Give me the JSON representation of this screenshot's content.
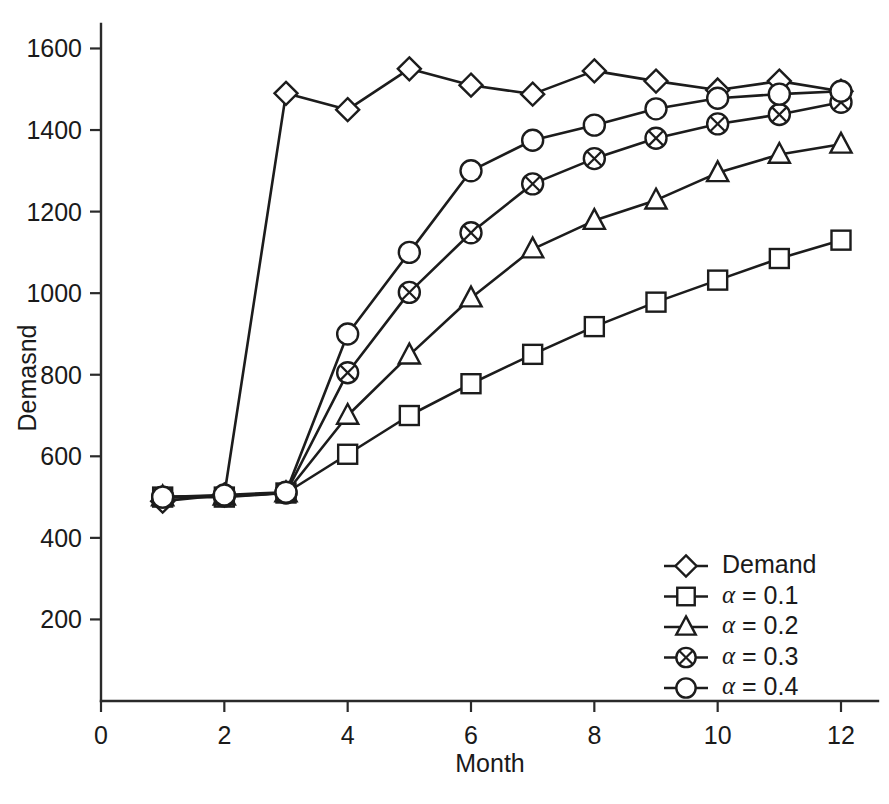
{
  "chart_data": {
    "type": "line",
    "title": "",
    "xlabel": "Month",
    "ylabel": "Demasnd",
    "x": [
      1,
      2,
      3,
      4,
      5,
      6,
      7,
      8,
      9,
      10,
      11,
      12
    ],
    "xlim": [
      0,
      12.6
    ],
    "ylim": [
      0,
      1660
    ],
    "xticks": [
      0,
      2,
      4,
      6,
      8,
      10,
      12
    ],
    "xticklabels": [
      "0",
      "2",
      "4",
      "6",
      "8",
      "10",
      "12"
    ],
    "yticks": [
      200,
      400,
      600,
      800,
      1000,
      1200,
      1400,
      1600
    ],
    "yticklabels": [
      "200",
      "400",
      "600",
      "800",
      "1000",
      "1200",
      "1400",
      "1600"
    ],
    "grid": false,
    "legend_position": "lower-right",
    "series": [
      {
        "name": "Demand",
        "marker": "diamond",
        "values": [
          490,
          505,
          1490,
          1450,
          1550,
          1510,
          1488,
          1545,
          1520,
          1498,
          1520,
          1495
        ]
      },
      {
        "name": "α = 0.1",
        "marker": "square",
        "values": [
          500,
          500,
          510,
          605,
          700,
          778,
          850,
          918,
          978,
          1032,
          1085,
          1130
        ]
      },
      {
        "name": "α = 0.2",
        "marker": "triangle",
        "values": [
          500,
          502,
          510,
          700,
          848,
          988,
          1108,
          1178,
          1228,
          1295,
          1340,
          1365
        ]
      },
      {
        "name": "α = 0.3",
        "marker": "circle-x",
        "values": [
          500,
          503,
          510,
          805,
          1002,
          1148,
          1268,
          1330,
          1380,
          1415,
          1438,
          1468
        ]
      },
      {
        "name": "α = 0.4",
        "marker": "circle",
        "values": [
          500,
          505,
          512,
          900,
          1100,
          1300,
          1375,
          1412,
          1452,
          1478,
          1488,
          1495
        ]
      }
    ]
  },
  "legend": {
    "items": [
      {
        "label": "Demand",
        "marker": "diamond"
      },
      {
        "label": "α = 0.1",
        "marker": "square"
      },
      {
        "label": "α = 0.2",
        "marker": "triangle"
      },
      {
        "label": "α = 0.3",
        "marker": "circle-x"
      },
      {
        "label": "α = 0.4",
        "marker": "circle"
      }
    ]
  },
  "colors": {
    "ink": "#1c1c1c",
    "axis": "#2a2a2a",
    "background": "#ffffff",
    "marker_fill": "#ffffff"
  }
}
